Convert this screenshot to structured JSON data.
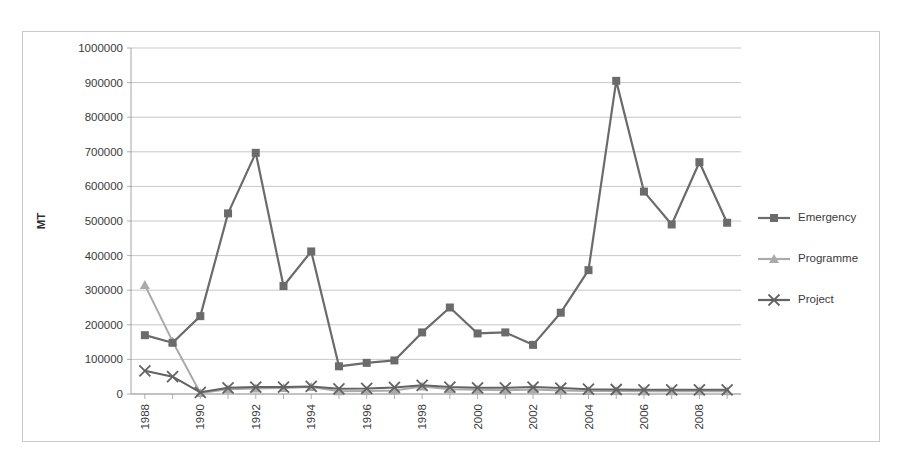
{
  "chart_data": {
    "type": "line",
    "title": "",
    "xlabel": "",
    "ylabel": "MT",
    "ylim": [
      0,
      1000000
    ],
    "ytick_step": 100000,
    "yticks": [
      "0",
      "100000",
      "200000",
      "300000",
      "400000",
      "500000",
      "600000",
      "700000",
      "800000",
      "900000",
      "1000000"
    ],
    "grid": "horizontal",
    "legend_position": "right",
    "x": [
      1988,
      1989,
      1990,
      1991,
      1992,
      1993,
      1994,
      1995,
      1996,
      1997,
      1998,
      1999,
      2000,
      2001,
      2002,
      2003,
      2004,
      2005,
      2006,
      2007,
      2008,
      2009
    ],
    "xticklabels_shown": [
      "1988",
      "1990",
      "1992",
      "1994",
      "1996",
      "1998",
      "2000",
      "2002",
      "2004",
      "2006",
      "2008"
    ],
    "xticklabel_rotation": 90,
    "series": [
      {
        "name": "Emergency",
        "color": "#6b6b6b",
        "marker": "square",
        "values": [
          170000,
          148000,
          225000,
          522000,
          697000,
          312000,
          412000,
          80000,
          90000,
          97000,
          178000,
          250000,
          175000,
          178000,
          142000,
          235000,
          358000,
          905000,
          585000,
          490000,
          670000,
          495000
        ]
      },
      {
        "name": "Programme",
        "color": "#aaaaaa",
        "marker": "triangle",
        "values": [
          315000,
          152000,
          3000,
          14000,
          16000,
          17000,
          20000,
          8000,
          9000,
          10000,
          22000,
          14000,
          12000,
          11000,
          13000,
          10000,
          9000,
          9000,
          8000,
          8000,
          8000,
          8000
        ]
      },
      {
        "name": "Project",
        "color": "#636363",
        "marker": "x",
        "values": [
          67000,
          50000,
          5000,
          18000,
          20000,
          20000,
          22000,
          15000,
          16000,
          19000,
          25000,
          20000,
          18000,
          18000,
          20000,
          17000,
          14000,
          13000,
          12000,
          12000,
          12000,
          12000
        ]
      }
    ]
  },
  "axis": {
    "y_title": "MT"
  },
  "legend": {
    "items": [
      {
        "label": "Emergency"
      },
      {
        "label": "Programme"
      },
      {
        "label": "Project"
      }
    ]
  }
}
